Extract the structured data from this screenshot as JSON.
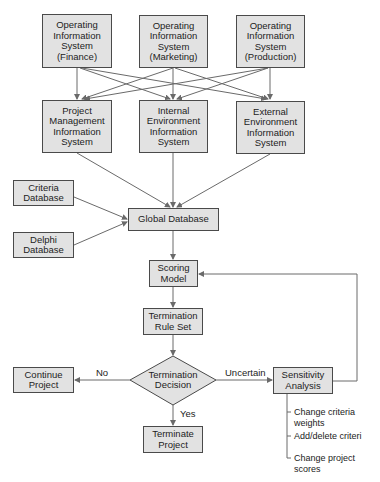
{
  "diagram": {
    "top_row": [
      {
        "label": "Operating\nInformation\nSystem\n(Finance)"
      },
      {
        "label": "Operating\nInformation\nSystem\n(Marketing)"
      },
      {
        "label": "Operating\nInformation\nSystem\n(Production)"
      }
    ],
    "second_row": [
      {
        "label": "Project\nManagement\nInformation\nSystem"
      },
      {
        "label": "Internal\nEnvironment\nInformation\nSystem"
      },
      {
        "label": "External\nEnvironment\nInformation\nSystem"
      }
    ],
    "criteria_database": "Criteria\nDatabase",
    "delphi_database": "Delphi\nDatabase",
    "global_database": "Global Database",
    "scoring_model": "Scoring\nModel",
    "termination_rule_set": "Termination\nRule Set",
    "termination_decision": "Termination\nDecision",
    "continue_project": "Continue\nProject",
    "terminate_project": "Terminate\nProject",
    "sensitivity_analysis": "Sensitivity\nAnalysis",
    "edge_labels": {
      "no": "No",
      "yes": "Yes",
      "uncertain": "Uncertain"
    },
    "sensitivity_options": [
      "Change criteria\nweights",
      "Add/delete criteri",
      "Change project\nscores"
    ],
    "colors": {
      "box_fill": "#e2e2e2",
      "box_border": "#4a4a4a",
      "line": "#6a6a6a"
    }
  }
}
